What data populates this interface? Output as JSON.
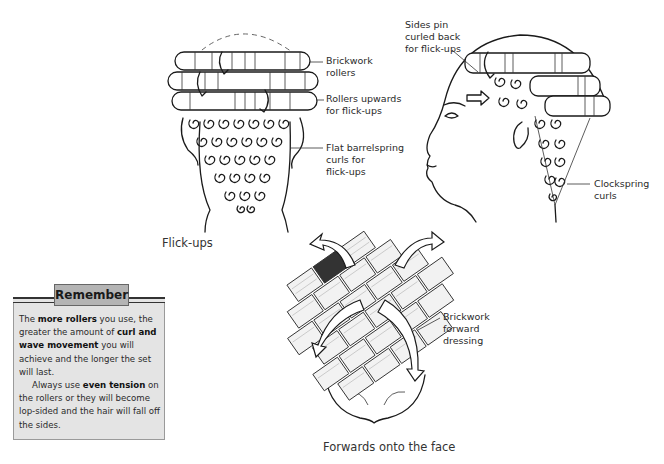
{
  "figure_flickups_back": {
    "labels": {
      "brickwork_rollers": [
        "Brickwork",
        "rollers"
      ],
      "rollers_upwards": [
        "Rollers upwards",
        "for flick-ups"
      ],
      "flat_barrelspring": [
        "Flat barrelspring",
        "curls for",
        "flick-ups"
      ]
    },
    "caption": "Flick-ups"
  },
  "figure_flickups_side": {
    "labels": {
      "sides_pin": [
        "Sides pin",
        "curled back",
        "for flick-ups"
      ],
      "clockspring": [
        "Clockspring",
        "curls"
      ]
    }
  },
  "figure_forwards": {
    "labels": {
      "brickwork_forward": [
        "Brickwork",
        "forward",
        "dressing"
      ]
    },
    "caption": "Forwards onto the face"
  },
  "remember_box": {
    "title": "Remember",
    "p1": {
      "t1": "The ",
      "b1": "more rollers",
      "t2": " you use, the greater the amount of ",
      "b2": "curl and wave movement",
      "t3": " you will achieve and the longer the set will last."
    },
    "p2": {
      "t1": "Always use ",
      "b1": "even tension",
      "t2": " on the rollers or they will become lop-sided and the hair will fall off the sides."
    }
  },
  "colors": {
    "box_bg": "#e4e4e4",
    "title_bg": "#b4b4b4",
    "ink": "#1a1a1a"
  }
}
